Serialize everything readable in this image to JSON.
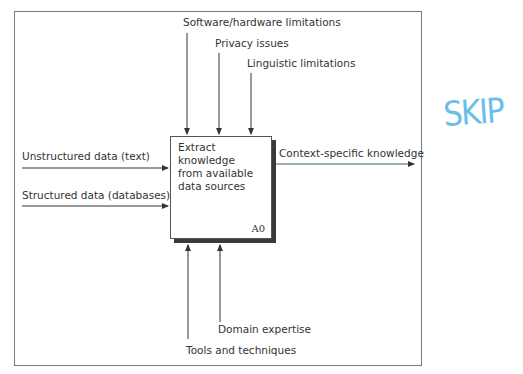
{
  "diagram": {
    "type": "IDEF0",
    "process": {
      "label": "Extract\nknowledge\nfrom available\ndata sources",
      "id": "A0"
    },
    "controls": [
      {
        "label": "Software/hardware limitations"
      },
      {
        "label": "Privacy issues"
      },
      {
        "label": "Linguistic limitations"
      }
    ],
    "inputs": [
      {
        "label": "Unstructured data (text)"
      },
      {
        "label": "Structured data (databases)"
      }
    ],
    "outputs": [
      {
        "label": "Context-specific knowledge"
      }
    ],
    "mechanisms": [
      {
        "label": "Domain expertise"
      },
      {
        "label": "Tools and techniques"
      }
    ]
  },
  "annotation": {
    "handwritten": "SKIP",
    "color": "#5bb8e8"
  },
  "colors": {
    "line": "#333333",
    "output_line": "#3a6b3a"
  }
}
